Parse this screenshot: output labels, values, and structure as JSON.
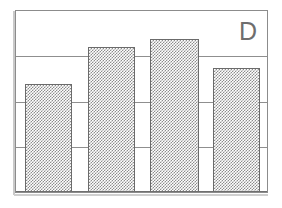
{
  "figure": {
    "panel_label": "D",
    "background_color": "#ffffff",
    "frame_color": "#8c8c8c",
    "gridline_color": "#8f8f8f",
    "bar_fill_color": "#8d8d8d",
    "bar_outline_color": "#6b6b6b",
    "label_color": "#6e6e6e"
  },
  "chart_data": {
    "type": "bar",
    "title": "D",
    "xlabel": "",
    "ylabel": "",
    "categories": [
      "1",
      "2",
      "3",
      "4"
    ],
    "values": [
      2.38,
      3.21,
      3.39,
      2.75
    ],
    "ylim": [
      0,
      4
    ],
    "yticks": [
      0,
      1,
      2,
      3,
      4
    ],
    "ytick_labels": [
      "",
      "",
      "",
      "",
      ""
    ],
    "xtick_labels": [
      "",
      "",
      "",
      ""
    ],
    "grid": "horizontal",
    "legend": "none",
    "annotations": [
      "D"
    ],
    "bars": [
      {
        "category": "1",
        "value": 2.38,
        "fill": "gray-stipple"
      },
      {
        "category": "2",
        "value": 3.21,
        "fill": "gray-stipple"
      },
      {
        "category": "3",
        "value": 3.39,
        "fill": "gray-stipple"
      },
      {
        "category": "4",
        "value": 2.75,
        "fill": "gray-stipple"
      }
    ]
  }
}
